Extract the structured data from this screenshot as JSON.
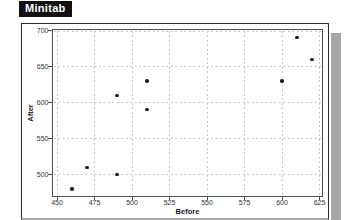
{
  "logo": {
    "label": "Minitab"
  },
  "colors": {
    "background": "#ffffff",
    "logo_bg": "#111111",
    "logo_text": "#ffffff",
    "frame_border": "#2b2b2b",
    "plot_border": "#4f4f4f",
    "grid": "#c6c6c6",
    "point": "#1a1a1a",
    "tick_text": "#333333",
    "shadow": "#a6a6a6"
  },
  "chart_data": {
    "type": "scatter",
    "title": "",
    "xlabel": "Before",
    "ylabel": "After",
    "x_ticks": [
      450,
      475,
      500,
      525,
      550,
      575,
      600,
      625
    ],
    "y_ticks": [
      500,
      550,
      600,
      650,
      700
    ],
    "xlim": [
      447,
      627
    ],
    "ylim": [
      470,
      700
    ],
    "grid": true,
    "legend": false,
    "marker": "filled-circle",
    "points": [
      {
        "x": 460,
        "y": 480
      },
      {
        "x": 470,
        "y": 510
      },
      {
        "x": 490,
        "y": 500
      },
      {
        "x": 490,
        "y": 610
      },
      {
        "x": 510,
        "y": 590
      },
      {
        "x": 510,
        "y": 630
      },
      {
        "x": 600,
        "y": 630
      },
      {
        "x": 610,
        "y": 690
      },
      {
        "x": 620,
        "y": 660
      }
    ]
  }
}
